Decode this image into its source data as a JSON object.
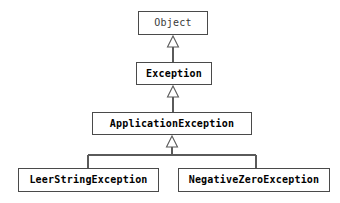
{
  "diagram": {
    "type": "uml-class-inheritance",
    "background_color": "#ffffff",
    "border_color": "#4a4a4a",
    "text_color": "#111111",
    "relationship_kind": "generalization",
    "arrowhead": "hollow-triangle",
    "nodes": [
      {
        "id": "object",
        "label": "Object",
        "style": "regular",
        "x": 138,
        "y": 11,
        "w": 70,
        "h": 24
      },
      {
        "id": "exception",
        "label": "Exception",
        "style": "bold",
        "x": 136,
        "y": 62,
        "w": 76,
        "h": 23
      },
      {
        "id": "application-exception",
        "label": "ApplicationException",
        "style": "bold",
        "x": 92,
        "y": 112,
        "w": 160,
        "h": 23
      },
      {
        "id": "leer-string-exception",
        "label": "LeerStringException",
        "style": "bold",
        "x": 18,
        "y": 168,
        "w": 141,
        "h": 24
      },
      {
        "id": "negative-zero-exception",
        "label": "NegativeZeroException",
        "style": "bold",
        "x": 178,
        "y": 168,
        "w": 152,
        "h": 24
      }
    ],
    "edges": [
      {
        "id": "edge-exception-to-object",
        "from": "exception",
        "to": "object"
      },
      {
        "id": "edge-applicationexception-to-exception",
        "from": "application-exception",
        "to": "exception"
      },
      {
        "id": "edge-leerstringexception-to-applicationexception",
        "from": "leer-string-exception",
        "to": "application-exception"
      },
      {
        "id": "edge-negativezeroexception-to-applicationexception",
        "from": "negative-zero-exception",
        "to": "application-exception"
      }
    ]
  }
}
